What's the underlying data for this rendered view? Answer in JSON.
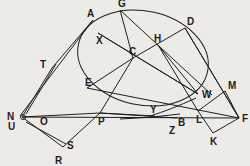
{
  "figure": {
    "type": "geometric-construction",
    "background_color": "#ecebe8",
    "ink_color": "#1e1e1e",
    "curve": {
      "kind": "ellipse",
      "label_points_on_curve": [
        "A",
        "G",
        "D",
        "W",
        "E"
      ]
    },
    "points": [
      "A",
      "G",
      "D",
      "H",
      "C",
      "X",
      "T",
      "E",
      "P",
      "N",
      "U",
      "O",
      "S",
      "R",
      "W",
      "Y",
      "B",
      "Z",
      "L",
      "M",
      "F",
      "K"
    ],
    "labels": {
      "A": "A",
      "G": "G",
      "D": "D",
      "H": "H",
      "C": "C",
      "X": "X",
      "T": "T",
      "E": "E",
      "P": "P",
      "N": "N",
      "U": "U",
      "O": "O",
      "S": "S",
      "R": "R",
      "W": "W",
      "Y": "Y",
      "B": "B",
      "Z": "Z",
      "L": "L",
      "M": "M",
      "F": "F",
      "K": "K"
    },
    "segments": [
      [
        "A",
        "T"
      ],
      [
        "G",
        "C"
      ],
      [
        "C",
        "D"
      ],
      [
        "H",
        "W"
      ],
      [
        "H",
        "L"
      ],
      [
        "C",
        "P"
      ],
      [
        "E",
        "C"
      ],
      [
        "N",
        "P"
      ],
      [
        "N",
        "T"
      ],
      [
        "N",
        "S"
      ],
      [
        "P",
        "S"
      ],
      [
        "E",
        "F"
      ],
      [
        "P",
        "B"
      ],
      [
        "D",
        "F"
      ],
      [
        "L",
        "M"
      ],
      [
        "M",
        "F"
      ],
      [
        "L",
        "K"
      ],
      [
        "K",
        "F"
      ],
      [
        "N",
        "F"
      ],
      [
        "X",
        "W"
      ]
    ]
  }
}
